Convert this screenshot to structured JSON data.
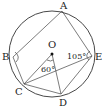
{
  "diagram": {
    "type": "geometry-circle",
    "circle": {
      "center": "O",
      "cx": 52,
      "cy": 54,
      "r": 43
    },
    "points": [
      {
        "id": "A",
        "label": "A",
        "x": 62,
        "y": 11,
        "lx": 60,
        "ly": 9
      },
      {
        "id": "B",
        "label": "B",
        "x": 13,
        "y": 57,
        "lx": 2,
        "ly": 60
      },
      {
        "id": "C",
        "label": "C",
        "x": 24,
        "y": 84,
        "lx": 15,
        "ly": 95
      },
      {
        "id": "D",
        "label": "D",
        "x": 61,
        "y": 94,
        "lx": 59,
        "ly": 106
      },
      {
        "id": "E",
        "label": "E",
        "x": 92,
        "y": 56,
        "lx": 95,
        "ly": 60
      },
      {
        "id": "O",
        "label": "O",
        "x": 52,
        "y": 54,
        "lx": 48,
        "ly": 48
      }
    ],
    "segments": [
      [
        "A",
        "B"
      ],
      [
        "A",
        "E"
      ],
      [
        "B",
        "C"
      ],
      [
        "C",
        "E"
      ],
      [
        "C",
        "D"
      ],
      [
        "D",
        "E"
      ],
      [
        "O",
        "C"
      ],
      [
        "O",
        "D"
      ]
    ],
    "angle_labels": [
      {
        "text": "60°",
        "x": 41,
        "y": 72
      },
      {
        "text": "105°",
        "x": 67,
        "y": 59
      }
    ]
  }
}
